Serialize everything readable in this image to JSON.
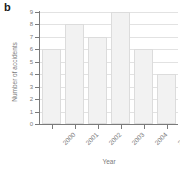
{
  "panel": {
    "label": "b"
  },
  "chart_data": {
    "type": "bar",
    "title": "",
    "xlabel": "Year",
    "ylabel": "Number of accidents",
    "categories": [
      "2000",
      "2001",
      "2002",
      "2003",
      "2004",
      "2005"
    ],
    "values": [
      6,
      8,
      7,
      9,
      6,
      4
    ],
    "series": [
      {
        "name": "Number of accidents",
        "values": [
          6,
          8,
          7,
          9,
          6,
          4
        ]
      }
    ],
    "ylim": [
      0,
      9
    ],
    "yticks": [
      0,
      1,
      2,
      3,
      4,
      5,
      6,
      7,
      8,
      9
    ],
    "ytick_labels": [
      "0",
      "1",
      "2",
      "3",
      "4",
      "5",
      "6",
      "7",
      "8",
      "9"
    ],
    "xtick_labels": [
      "2000",
      "2001",
      "2002",
      "2003",
      "2004",
      "2005"
    ],
    "xtick_rotation": -45,
    "grid": "horizontal",
    "legend": "none",
    "bar_fill_color": "#f2f2f2",
    "bar_edge_color": "#dcdcdc",
    "axis_color": "#7a7a7a",
    "gridline_color": "#e2e2e2",
    "background_color": "#ffffff"
  }
}
